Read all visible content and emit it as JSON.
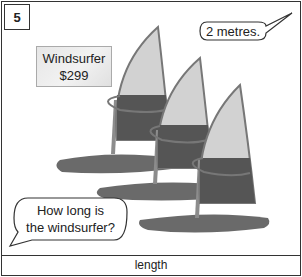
{
  "question": {
    "number": "5",
    "price_tag": {
      "item": "Windsurfer",
      "price": "$299"
    },
    "speech_bubble_answer": "2 metres.",
    "speech_bubble_question_line1": "How long is",
    "speech_bubble_question_line2": "the windsurfer?",
    "answer_row_label": "length"
  },
  "illustration": {
    "subject": "three windsurfers",
    "count": 3,
    "colors": {
      "sail_light": "#d2d2d2",
      "sail_dark": "#555555",
      "board": "#6a6a6a",
      "mast": "#8c8c8c",
      "outline": "#333333"
    }
  }
}
